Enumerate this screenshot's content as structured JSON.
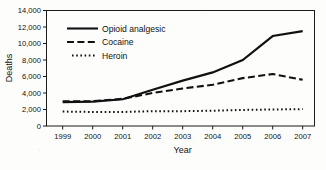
{
  "chart_data": {
    "type": "line",
    "title": "",
    "xlabel": "Year",
    "ylabel": "Deaths",
    "categories": [
      "1999",
      "2000",
      "2001",
      "2002",
      "2003",
      "2004",
      "2005",
      "2006",
      "2007"
    ],
    "x": [
      1999,
      2000,
      2001,
      2002,
      2003,
      2004,
      2005,
      2006,
      2007
    ],
    "xlim": [
      1999,
      2007
    ],
    "ylim": [
      0,
      14000
    ],
    "grid": false,
    "legend_position": "inside-top-left",
    "ytick_labels": [
      "14,000",
      "12,000",
      "10,000",
      "8,000",
      "6,000",
      "4,000",
      "2,000",
      "0"
    ],
    "ytick_values": [
      14000,
      12000,
      10000,
      8000,
      6000,
      4000,
      2000,
      0
    ],
    "series": [
      {
        "name": "Opioid analgesic",
        "style": "solid",
        "color": "#111111",
        "values": [
          2900,
          2950,
          3250,
          4400,
          5500,
          6500,
          8000,
          10900,
          11500
        ]
      },
      {
        "name": "Cocaine",
        "style": "dashed",
        "color": "#111111",
        "values": [
          3000,
          3000,
          3300,
          4000,
          4550,
          5000,
          5800,
          6300,
          5600
        ]
      },
      {
        "name": "Heroin",
        "style": "dotted",
        "color": "#111111",
        "values": [
          1750,
          1700,
          1700,
          1800,
          1800,
          1850,
          1950,
          2000,
          2050
        ]
      }
    ]
  },
  "legend": {
    "items": [
      {
        "label": "Opioid analgesic"
      },
      {
        "label": "Cocaine"
      },
      {
        "label": "Heroin"
      }
    ]
  }
}
